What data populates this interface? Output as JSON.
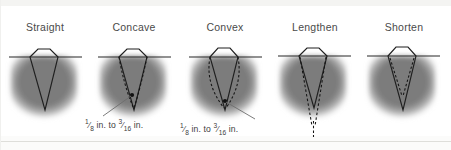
{
  "figure": {
    "background_color": "#ffffff",
    "material_color": "#7f7f7f",
    "line_color": "#262626",
    "label_color": "#4a4a4a"
  },
  "panels": [
    {
      "id": "straight",
      "label": "Straight",
      "description": "Symmetrical straight-sided V groove, reference profile",
      "has_dashed_overlay": false,
      "has_callout": false,
      "dimension_note": null
    },
    {
      "id": "concave",
      "label": "Concave",
      "description": "Groove walls bowed inward, dashed lines show concave face",
      "has_dashed_overlay": true,
      "has_callout": true,
      "dimension_note": {
        "whole_fraction_1": {
          "numerator": "1",
          "denominator": "8"
        },
        "unit_1": "in.",
        "connector": "to",
        "whole_fraction_2": {
          "numerator": "3",
          "denominator": "16"
        },
        "unit_2": "in.",
        "plain_text": "1/8 in. to 3/16 in."
      }
    },
    {
      "id": "convex",
      "label": "Convex",
      "description": "Groove walls bowed outward, dashed lines show convex face",
      "has_dashed_overlay": true,
      "has_callout": true,
      "dimension_note": {
        "whole_fraction_1": {
          "numerator": "1",
          "denominator": "8"
        },
        "unit_1": "in.",
        "connector": "to",
        "whole_fraction_2": {
          "numerator": "3",
          "denominator": "16"
        },
        "unit_2": "in.",
        "plain_text": "1/8 in. to 3/16 in."
      }
    },
    {
      "id": "lengthen",
      "label": "Lengthen",
      "description": "Dashed lines extend the groove deeper below the root",
      "has_dashed_overlay": true,
      "has_callout": false,
      "dimension_note": null
    },
    {
      "id": "shorten",
      "label": "Shorten",
      "description": "Dashed lines converge higher, shortening the groove",
      "has_dashed_overlay": true,
      "has_callout": false,
      "dimension_note": null
    }
  ]
}
